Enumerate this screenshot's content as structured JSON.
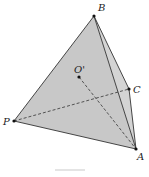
{
  "figure": {
    "type": "tetrahedron",
    "colors": {
      "face_fill": "#c8c8c8",
      "face_fill_right": "#d4d4d4",
      "edge": "#333333",
      "point": "#111111",
      "label": "#222222"
    },
    "vertices": {
      "B": {
        "label": "B",
        "x": 94,
        "y": 16,
        "label_x": 98,
        "label_y": 11
      },
      "O": {
        "label": "O'",
        "x": 79,
        "y": 77,
        "label_x": 75,
        "label_y": 73
      },
      "C": {
        "label": "C",
        "x": 129,
        "y": 89,
        "label_x": 133,
        "label_y": 93
      },
      "P": {
        "label": "P",
        "x": 14,
        "y": 121,
        "label_x": 3,
        "label_y": 125
      },
      "A": {
        "label": "A",
        "x": 136,
        "y": 149,
        "label_x": 137,
        "label_y": 160
      }
    },
    "solid_edges": [
      [
        "B",
        "P"
      ],
      [
        "P",
        "A"
      ],
      [
        "B",
        "A"
      ],
      [
        "B",
        "C"
      ],
      [
        "C",
        "A"
      ]
    ],
    "dashed_edges": [
      [
        "P",
        "C"
      ],
      [
        "O",
        "A"
      ]
    ]
  }
}
